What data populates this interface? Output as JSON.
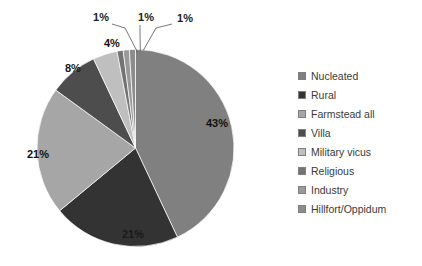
{
  "chart_data": {
    "type": "pie",
    "title": "",
    "categories": [
      "Nucleated",
      "Rural",
      "Farmstead all",
      "Villa",
      "Military vicus",
      "Religious",
      "Industry",
      "Hillfort/Oppidum"
    ],
    "values": [
      43,
      21,
      21,
      8,
      4,
      1,
      1,
      1
    ],
    "value_labels": [
      "43%",
      "21%",
      "21%",
      "8%",
      "4%",
      "1%",
      "1%",
      "1%"
    ],
    "colors": [
      "#808080",
      "#333333",
      "#a6a6a6",
      "#4d4d4d",
      "#bfbfbf",
      "#737373",
      "#999999",
      "#8c8c8c"
    ],
    "legend_position": "right",
    "start_angle_deg": 0,
    "direction": "clockwise",
    "labels_inside": [
      true,
      true,
      true,
      true,
      true,
      false,
      false,
      false
    ],
    "grid": false
  },
  "legend": {
    "items": [
      {
        "label": "Nucleated",
        "color": "#808080"
      },
      {
        "label": "Rural",
        "color": "#333333"
      },
      {
        "label": "Farmstead all",
        "color": "#a6a6a6"
      },
      {
        "label": "Villa",
        "color": "#4d4d4d"
      },
      {
        "label": "Military vicus",
        "color": "#bfbfbf"
      },
      {
        "label": "Religious",
        "color": "#737373"
      },
      {
        "label": "Industry",
        "color": "#999999"
      },
      {
        "label": "Hillfort/Oppidum",
        "color": "#8c8c8c"
      }
    ]
  },
  "pie_labels": {
    "nucleated": "43%",
    "rural": "21%",
    "farmstead": "21%",
    "villa": "8%",
    "military": "4%",
    "religious": "1%",
    "industry": "1%",
    "hillfort": "1%"
  }
}
